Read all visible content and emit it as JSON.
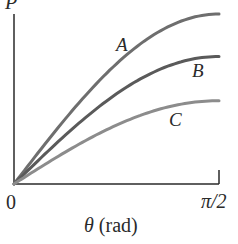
{
  "chart_data": {
    "type": "line",
    "title": "",
    "xlabel": "θ (rad)",
    "ylabel": "P",
    "x_ticks": [
      "0",
      "π/2"
    ],
    "xlim": [
      0,
      1.5708
    ],
    "grid": false,
    "legend": "inline labels",
    "series": [
      {
        "name": "A",
        "shape": "sine",
        "relative_max": 1.0,
        "color": "#6e6e6e"
      },
      {
        "name": "B",
        "shape": "sine",
        "relative_max": 0.75,
        "color": "#5a5a5a"
      },
      {
        "name": "C",
        "shape": "sine",
        "relative_max": 0.49,
        "color": "#8c8c8c"
      }
    ]
  },
  "labels": {
    "y_axis": "P",
    "x_axis": "θ (rad)",
    "origin": "0",
    "x_end": "π/2",
    "curve_a": "A",
    "curve_b": "B",
    "curve_c": "C"
  }
}
